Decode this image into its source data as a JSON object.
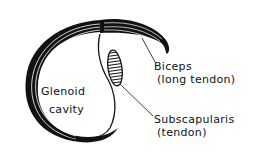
{
  "diagram": {
    "type": "anatomical-line-drawing",
    "colors": {
      "ink": "#111111",
      "background": "#ffffff"
    },
    "labels": {
      "glenoid_line1": "Glenoid",
      "glenoid_line2": "cavity",
      "biceps_line1": "Biceps",
      "biceps_line2": "(long tendon)",
      "subscap_line1": "Subscapularis",
      "subscap_line2": "(tendon)"
    }
  }
}
